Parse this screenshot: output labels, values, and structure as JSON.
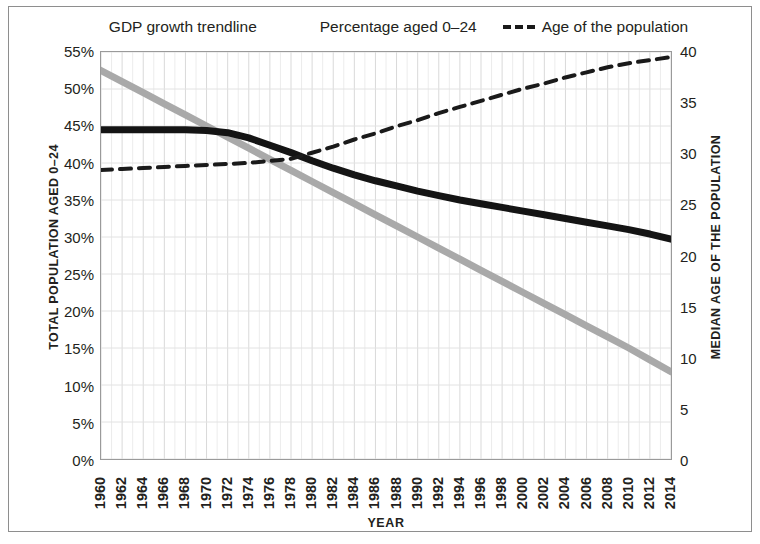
{
  "chart_data": {
    "type": "line",
    "title": "",
    "xlabel": "YEAR",
    "ylabel": "TOTAL POPULATION AGED 0–24",
    "ylabel_right": "MEDIAN AGE OF THE POPULATION",
    "grid": true,
    "legend_position": "top-center",
    "xlim": [
      1960,
      2014
    ],
    "ylim": [
      0,
      55
    ],
    "ylim_right": [
      0,
      40
    ],
    "x": [
      1960,
      1962,
      1964,
      1966,
      1968,
      1970,
      1972,
      1974,
      1976,
      1978,
      1980,
      1982,
      1984,
      1986,
      1988,
      1990,
      1992,
      1994,
      1996,
      1998,
      2000,
      2002,
      2004,
      2006,
      2008,
      2010,
      2012,
      2014
    ],
    "xticks": [
      "1960",
      "1962",
      "1964",
      "1966",
      "1968",
      "1970",
      "1972",
      "1974",
      "1976",
      "1978",
      "1980",
      "1982",
      "1984",
      "1986",
      "1988",
      "1990",
      "1992",
      "1994",
      "1996",
      "1998",
      "2000",
      "2002",
      "2004",
      "2006",
      "2008",
      "2010",
      "2012",
      "2014"
    ],
    "yticks_left": [
      "0%",
      "5%",
      "10%",
      "15%",
      "20%",
      "25%",
      "30%",
      "35%",
      "40%",
      "45%",
      "50%",
      "55%"
    ],
    "ytick_values_left": [
      0,
      5,
      10,
      15,
      20,
      25,
      30,
      35,
      40,
      45,
      50,
      55
    ],
    "yticks_right": [
      "0",
      "5",
      "10",
      "15",
      "20",
      "25",
      "30",
      "35",
      "40"
    ],
    "ytick_values_right": [
      0,
      5,
      10,
      15,
      20,
      25,
      30,
      35,
      40
    ],
    "series": [
      {
        "name": "GDP growth trendline",
        "axis": "left",
        "color": "#a9a9a9",
        "style": "solid",
        "width": 7,
        "values": [
          52.5,
          51.0,
          49.5,
          48.0,
          46.5,
          45.0,
          43.5,
          42.0,
          40.5,
          39.0,
          37.5,
          36.0,
          34.5,
          33.0,
          31.5,
          30.0,
          28.5,
          27.0,
          25.5,
          24.0,
          22.5,
          21.0,
          19.5,
          18.0,
          16.5,
          15.0,
          13.4,
          11.8
        ]
      },
      {
        "name": "Percentage aged 0–24",
        "axis": "left",
        "color": "#141414",
        "style": "solid",
        "width": 7,
        "values": [
          44.5,
          44.5,
          44.5,
          44.5,
          44.5,
          44.4,
          44.1,
          43.4,
          42.4,
          41.4,
          40.3,
          39.3,
          38.4,
          37.6,
          36.9,
          36.2,
          35.6,
          35.0,
          34.5,
          34.0,
          33.5,
          33.0,
          32.5,
          32.0,
          31.5,
          31.0,
          30.4,
          29.7
        ]
      },
      {
        "name": "Age of the population",
        "axis": "right",
        "color": "#1a1a1a",
        "style": "dashed",
        "width": 4,
        "values": [
          28.4,
          28.5,
          28.6,
          28.7,
          28.8,
          28.9,
          29.0,
          29.1,
          29.3,
          29.5,
          30.1,
          30.7,
          31.4,
          32.0,
          32.7,
          33.3,
          34.0,
          34.6,
          35.2,
          35.8,
          36.4,
          36.9,
          37.5,
          38.0,
          38.5,
          38.9,
          39.2,
          39.5
        ]
      }
    ]
  },
  "legend": {
    "items": [
      {
        "label": "GDP growth trendline",
        "swatch": "gray-thick-line",
        "color": "#a9a9a9",
        "style": "solid"
      },
      {
        "label": "Percentage aged 0–24",
        "swatch": "black-thick-line",
        "color": "#141414",
        "style": "solid"
      },
      {
        "label": "Age of the population",
        "swatch": "black-dashed-line",
        "color": "#1a1a1a",
        "style": "dashed"
      }
    ]
  }
}
